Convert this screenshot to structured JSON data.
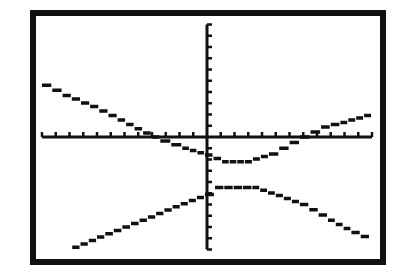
{
  "screen": {
    "background": "#ffffff",
    "ink": "#111111",
    "frame": {
      "x": 30,
      "y": 10,
      "width": 356,
      "height": 255,
      "thickness": 6
    }
  },
  "chart_data": {
    "type": "line",
    "title": "",
    "xlabel": "",
    "ylabel": "",
    "xlim": [
      -12,
      12
    ],
    "ylim": [
      -10,
      10
    ],
    "x_tick_step": 1,
    "y_tick_step": 1,
    "grid": false,
    "legend": "none",
    "style": "monochrome calculator pixel graph (hyperbola, two branches)",
    "series": [
      {
        "name": "upper branch",
        "points": [
          [
            -12,
            4.6
          ],
          [
            -10.5,
            3.7
          ],
          [
            -8.5,
            2.7
          ],
          [
            -6.5,
            1.5
          ],
          [
            -4.65,
            0.36
          ],
          [
            -3.4,
            -0.36
          ],
          [
            -1.8,
            -1.0
          ],
          [
            -0.15,
            -1.6
          ],
          [
            1.1,
            -2.2
          ],
          [
            2.76,
            -2.2
          ],
          [
            4.5,
            -1.5
          ],
          [
            6.76,
            0
          ],
          [
            8.3,
            0.9
          ],
          [
            9.7,
            1.3
          ],
          [
            12,
            2.1
          ]
        ]
      },
      {
        "name": "lower branch",
        "points": [
          [
            -9.8,
            -9.8
          ],
          [
            -7.4,
            -8.6
          ],
          [
            -4.9,
            -7.4
          ],
          [
            -2.5,
            -6.2
          ],
          [
            -0.15,
            -5.1
          ],
          [
            0.58,
            -4.5
          ],
          [
            3.3,
            -4.5
          ],
          [
            5.0,
            -5.2
          ],
          [
            6.76,
            -6.0
          ],
          [
            8.8,
            -7.4
          ],
          [
            10.5,
            -8.5
          ],
          [
            11.85,
            -9.2
          ]
        ]
      }
    ]
  }
}
